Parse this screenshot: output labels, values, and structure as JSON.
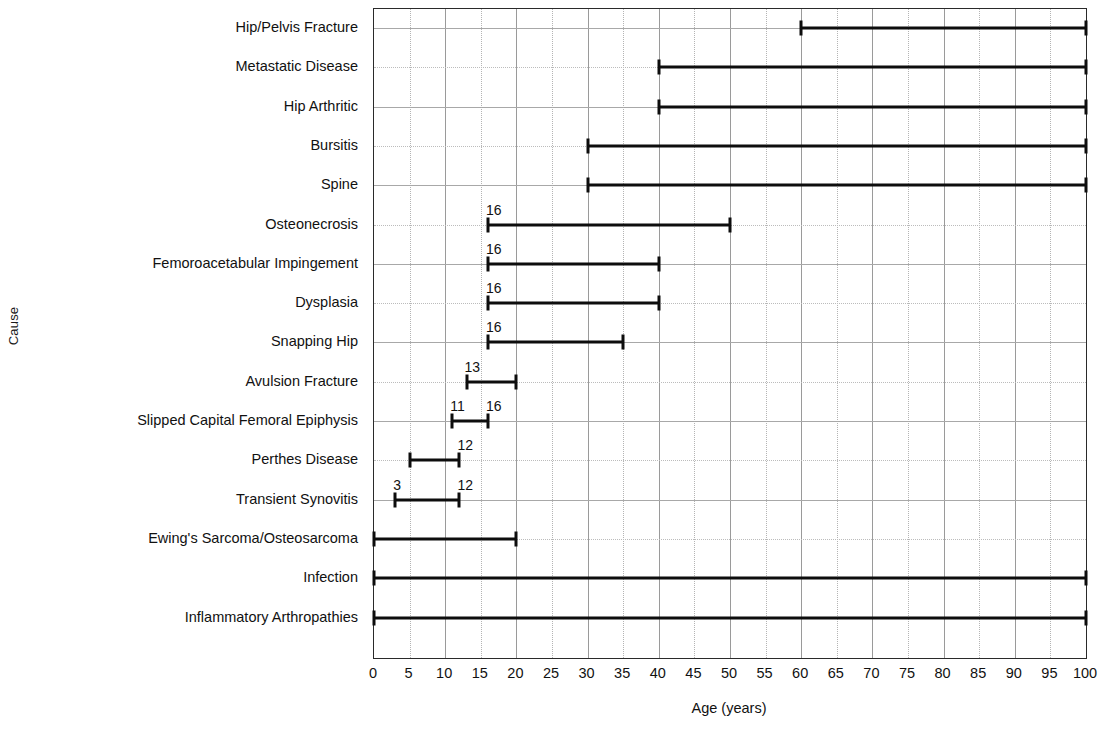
{
  "chart_data": {
    "type": "bar",
    "subtype": "range-bar",
    "title": "",
    "xlabel": "Age (years)",
    "ylabel": "Cause",
    "xlim": [
      0,
      100
    ],
    "xticks": [
      0,
      5,
      10,
      15,
      20,
      25,
      30,
      35,
      40,
      45,
      50,
      55,
      60,
      65,
      70,
      75,
      80,
      85,
      90,
      95,
      100
    ],
    "xtick_labels": [
      "0",
      "5",
      "10",
      "15",
      "20",
      "25",
      "30",
      "35",
      "40",
      "45",
      "50",
      "55",
      "60",
      "65",
      "70",
      "75",
      "80",
      "85",
      "90",
      "95",
      "100"
    ],
    "grid": true,
    "legend": false,
    "categories": [
      "Hip/Pelvis Fracture",
      "Metastatic Disease",
      "Hip Arthritic",
      "Bursitis",
      "Spine",
      "Osteonecrosis",
      "Femoroacetabular Impingement",
      "Dysplasia",
      "Snapping Hip",
      "Avulsion Fracture",
      "Slipped Capital Femoral Epiphysis",
      "Perthes Disease",
      "Transient Synovitis",
      "Ewing's Sarcoma/Osteosarcoma",
      "Infection",
      "Inflammatory Arthropathies"
    ],
    "ranges": [
      {
        "category": "Hip/Pelvis Fracture",
        "start": 60,
        "end": 100,
        "start_label": "",
        "end_label": ""
      },
      {
        "category": "Metastatic Disease",
        "start": 40,
        "end": 100,
        "start_label": "",
        "end_label": ""
      },
      {
        "category": "Hip Arthritic",
        "start": 40,
        "end": 100,
        "start_label": "",
        "end_label": ""
      },
      {
        "category": "Bursitis",
        "start": 30,
        "end": 100,
        "start_label": "",
        "end_label": ""
      },
      {
        "category": "Spine",
        "start": 30,
        "end": 100,
        "start_label": "",
        "end_label": ""
      },
      {
        "category": "Osteonecrosis",
        "start": 16,
        "end": 50,
        "start_label": "16",
        "end_label": ""
      },
      {
        "category": "Femoroacetabular Impingement",
        "start": 16,
        "end": 40,
        "start_label": "16",
        "end_label": ""
      },
      {
        "category": "Dysplasia",
        "start": 16,
        "end": 40,
        "start_label": "16",
        "end_label": ""
      },
      {
        "category": "Snapping Hip",
        "start": 16,
        "end": 35,
        "start_label": "16",
        "end_label": ""
      },
      {
        "category": "Avulsion Fracture",
        "start": 13,
        "end": 20,
        "start_label": "13",
        "end_label": ""
      },
      {
        "category": "Slipped Capital Femoral Epiphysis",
        "start": 11,
        "end": 16,
        "start_label": "11",
        "end_label": "16"
      },
      {
        "category": "Perthes Disease",
        "start": 5,
        "end": 12,
        "start_label": "",
        "end_label": "12"
      },
      {
        "category": "Transient Synovitis",
        "start": 3,
        "end": 12,
        "start_label": "3",
        "end_label": "12"
      },
      {
        "category": "Ewing's Sarcoma/Osteosarcoma",
        "start": 0,
        "end": 20,
        "start_label": "",
        "end_label": ""
      },
      {
        "category": "Infection",
        "start": 0,
        "end": 100,
        "start_label": "",
        "end_label": ""
      },
      {
        "category": "Inflammatory Arthropathies",
        "start": 0,
        "end": 100,
        "start_label": "",
        "end_label": ""
      }
    ]
  },
  "colors": {
    "bar": "#0d0d0d",
    "grid_solid": "#9a9a9a",
    "grid_dotted": "#bcbcbc",
    "axis": "#2a2a2a",
    "text": "#111111",
    "background": "#ffffff"
  }
}
